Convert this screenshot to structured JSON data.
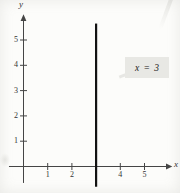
{
  "figure": {
    "background_color": "#fcfcfa",
    "axis_color": "#454545",
    "text_color": "#333333"
  },
  "chart_data": {
    "type": "line",
    "title": "",
    "grid": false,
    "legend": false,
    "x_axis": {
      "label": "x",
      "tick_labels": [
        1,
        2,
        4,
        5
      ],
      "range": [
        -0.6,
        6.1
      ]
    },
    "y_axis": {
      "label": "y",
      "tick_labels": [
        1,
        2,
        3,
        4,
        5
      ],
      "range": [
        -0.65,
        6.0
      ]
    },
    "series": [
      {
        "name": "vertical line x = 3",
        "color": "#121212",
        "points": [
          {
            "x": 3,
            "y": -0.8
          },
          {
            "x": 3,
            "y": 5.65
          }
        ]
      }
    ],
    "annotation": {
      "text": "x = 3",
      "boxed": true,
      "box_color": "#e8e8e4"
    }
  }
}
